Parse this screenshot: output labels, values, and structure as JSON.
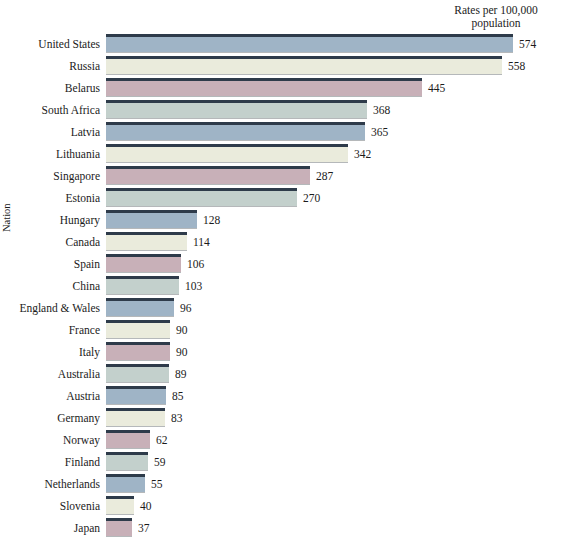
{
  "header_note": {
    "line1": "Rates per 100,000",
    "line2": "population"
  },
  "axis": {
    "y_title": "Nation"
  },
  "palette": {
    "blue": "#9fb4c6",
    "cream": "#eaebdc",
    "mauve": "#c8b0b8",
    "sage": "#c3d0cc",
    "bar_top_edge": "#2e3b4a",
    "background": "#ffffff",
    "text": "#1b1b1b"
  },
  "chart_data": {
    "type": "bar",
    "orientation": "horizontal",
    "title": "",
    "subtitle": "",
    "xlabel": "Rates per 100,000 population",
    "ylabel": "Nation",
    "xlim": [
      0,
      574
    ],
    "grid": false,
    "legend": null,
    "value_labels": true,
    "categories": [
      "United States",
      "Russia",
      "Belarus",
      "South Africa",
      "Latvia",
      "Lithuania",
      "Singapore",
      "Estonia",
      "Hungary",
      "Canada",
      "Spain",
      "China",
      "England & Wales",
      "France",
      "Italy",
      "Australia",
      "Austria",
      "Germany",
      "Norway",
      "Finland",
      "Netherlands",
      "Slovenia",
      "Japan"
    ],
    "values": [
      574,
      558,
      445,
      368,
      365,
      342,
      287,
      270,
      128,
      114,
      106,
      103,
      96,
      90,
      90,
      89,
      85,
      83,
      62,
      59,
      55,
      40,
      37
    ],
    "colors": [
      "#9fb4c6",
      "#eaebdc",
      "#c8b0b8",
      "#c3d0cc",
      "#9fb4c6",
      "#eaebdc",
      "#c8b0b8",
      "#c3d0cc",
      "#9fb4c6",
      "#eaebdc",
      "#c8b0b8",
      "#c3d0cc",
      "#9fb4c6",
      "#eaebdc",
      "#c8b0b8",
      "#c3d0cc",
      "#9fb4c6",
      "#eaebdc",
      "#c8b0b8",
      "#c3d0cc",
      "#9fb4c6",
      "#eaebdc",
      "#c8b0b8"
    ]
  }
}
